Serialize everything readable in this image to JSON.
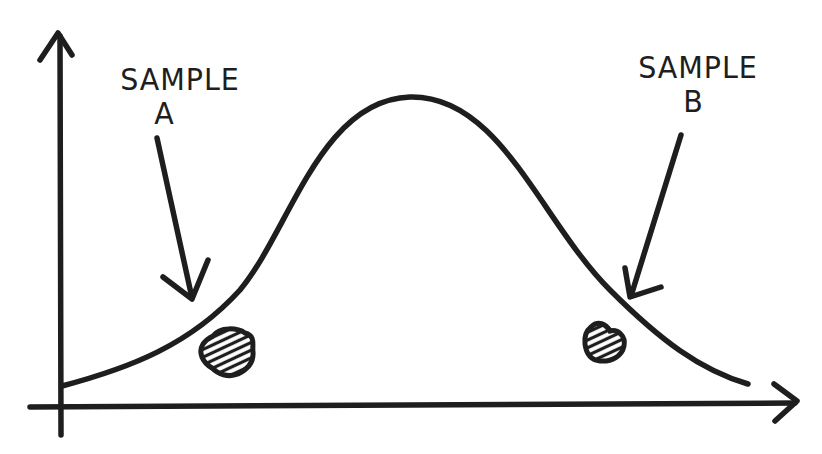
{
  "diagram": {
    "type": "hand-drawn normal distribution (bell curve)",
    "ink_color": "#1e1e1e",
    "background": "#ffffff",
    "labels": {
      "sample_a_line1": "SAMPLE",
      "sample_a_line2": "A",
      "sample_b_line1": "SAMPLE",
      "sample_b_line2": "B"
    },
    "elements": [
      {
        "name": "y-axis",
        "kind": "arrow",
        "direction": "up"
      },
      {
        "name": "x-axis",
        "kind": "arrow",
        "direction": "right"
      },
      {
        "name": "bell-curve",
        "kind": "curve",
        "peak_x_px": 410,
        "peak_y_px": 97
      },
      {
        "name": "sample-a-arrow",
        "kind": "arrow",
        "points_to": "left tail of curve"
      },
      {
        "name": "sample-b-arrow",
        "kind": "arrow",
        "points_to": "right tail of curve"
      },
      {
        "name": "sample-a-blob",
        "kind": "hatched blob",
        "position": "below left tail"
      },
      {
        "name": "sample-b-blob",
        "kind": "hatched blob",
        "position": "below right tail"
      }
    ]
  }
}
